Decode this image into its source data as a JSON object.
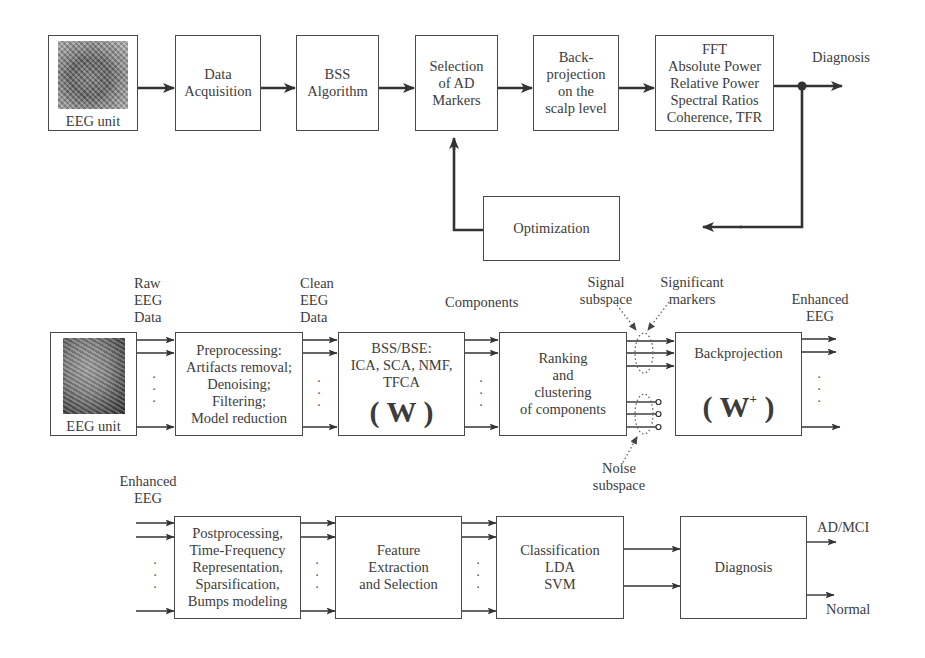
{
  "diagram_top": {
    "eeg_unit": "EEG unit",
    "data_acquisition": [
      "Data",
      "Acquisition"
    ],
    "bss_algorithm": [
      "BSS",
      "Algorithm"
    ],
    "selection": [
      "Selection",
      "of AD",
      "Markers"
    ],
    "backprojection": [
      "Back-",
      "projection",
      "on the",
      "scalp level"
    ],
    "features": [
      "FFT",
      "Absolute  Power",
      "Relative Power",
      "Spectral Ratios",
      "Coherence, TFR"
    ],
    "output_label": "Diagnosis",
    "optimization": "Optimization"
  },
  "diagram_middle": {
    "raw_label": [
      "Raw",
      "EEG",
      "Data"
    ],
    "clean_label": [
      "Clean",
      "EEG",
      "Data"
    ],
    "components_label": "Components",
    "signal_subspace": [
      "Signal",
      "subspace"
    ],
    "significant_markers": [
      "Significant",
      "markers"
    ],
    "enhanced_label": [
      "Enhanced",
      "EEG"
    ],
    "noise_subspace": [
      "Noise",
      "subspace"
    ],
    "eeg_unit": "EEG unit",
    "preprocessing": [
      "Preprocessing:",
      "Artifacts removal;",
      "Denoising;",
      "Filtering;",
      "Model reduction"
    ],
    "bss_bse": [
      "BSS/BSE:",
      "ICA, SCA, NMF,",
      "TFCA"
    ],
    "w_matrix": "( W )",
    "ranking": [
      "Ranking",
      "and",
      "clustering",
      "of components"
    ],
    "backprojection": "Backprojection",
    "w_plus_base": "W",
    "w_plus_sup": "+"
  },
  "diagram_bottom": {
    "enhanced_label": [
      "Enhanced",
      "EEG"
    ],
    "postprocessing": [
      "Postprocessing,",
      "Time-Frequency",
      "Representation,",
      "Sparsification,",
      "Bumps modeling"
    ],
    "feature_extraction": [
      "Feature",
      "Extraction",
      "and Selection"
    ],
    "classification": [
      "Classification",
      "LDA",
      "SVM"
    ],
    "diagnosis": "Diagnosis",
    "output_ad": "AD/MCI",
    "output_normal": "Normal"
  },
  "ellipsis": "·\n·\n·"
}
